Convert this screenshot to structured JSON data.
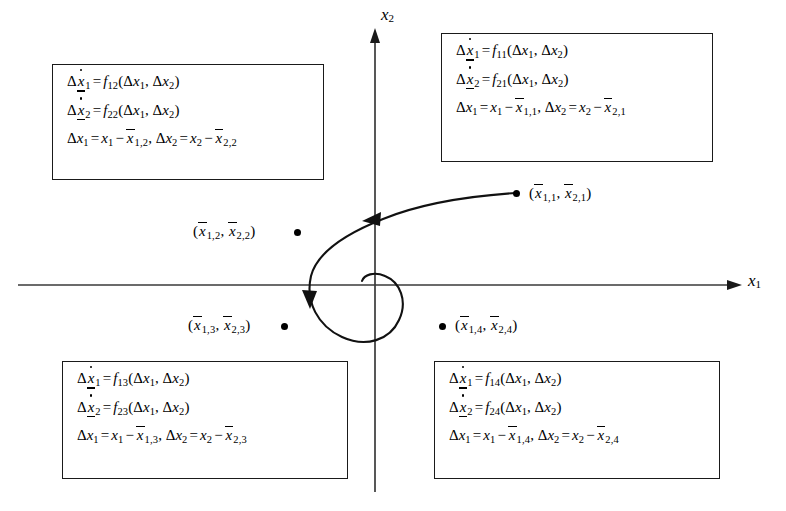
{
  "figure": {
    "type": "phase-plane-diagram"
  },
  "axes": {
    "x_label": "x",
    "x_sub": "1",
    "y_label": "x",
    "y_sub": "2",
    "origin": {
      "x": 375,
      "y": 285
    },
    "x_axis": {
      "x_start": 18,
      "x_end": 742,
      "y": 285
    },
    "y_axis": {
      "x": 375,
      "y_start": 28,
      "y_end": 492
    }
  },
  "symbols": {
    "delta": "Δ",
    "equals": "=",
    "minus": "−",
    "comma": ",",
    "lparen": "(",
    "rparen": ")",
    "x": "x",
    "f": "f",
    "dot_marker": "●"
  },
  "boxes": [
    {
      "id": "q1",
      "quadrant": "top-right",
      "f_row1": "11",
      "f_row2": "21",
      "ss_sub1": "1,1",
      "ss_sub2": "2,1",
      "lines": [
        "Δẋ̱₁ = f₁₁(Δx₁, Δx₂)",
        "Δẋ̱₂ = f₂₁(Δx₁, Δx₂)",
        "Δx₁ = x₁ − x̄₁,₁, Δx₂ = x₂ − x̄₂,₁"
      ]
    },
    {
      "id": "q2",
      "quadrant": "top-left",
      "f_row1": "12",
      "f_row2": "22",
      "ss_sub1": "1,2",
      "ss_sub2": "2,2",
      "lines": [
        "Δẋ̱₁ = f₁₂(Δx₁, Δx₂)",
        "Δẋ̱₂ = f₂₂(Δx₁, Δx₂)",
        "Δx₁ = x₁ − x̄₁,₂, Δx₂ = x₂ − x̄₂,₂"
      ]
    },
    {
      "id": "q3",
      "quadrant": "bottom-left",
      "f_row1": "13",
      "f_row2": "23",
      "ss_sub1": "1,3",
      "ss_sub2": "2,3",
      "lines": [
        "Δẋ̱₁ = f₁₃(Δx₁, Δx₂)",
        "Δẋ̱₂ = f₂₃(Δx₁, Δx₂)",
        "Δx₁ = x₁ − x̄₁,₃, Δx₂ = x₂ − x̄₂,₃"
      ]
    },
    {
      "id": "q4",
      "quadrant": "bottom-right",
      "f_row1": "14",
      "f_row2": "24",
      "ss_sub1": "1,4",
      "ss_sub2": "2,4",
      "lines": [
        "Δẋ̱₁ = f₁₄(Δx₁, Δx₂)",
        "Δẋ̱₂ = f₂₄(Δx₁, Δx₂)",
        "Δx₁ = x₁ − x̄₁,₄, Δx₂ = x₂ − x̄₂,₄"
      ]
    }
  ],
  "points": [
    {
      "id": "p1",
      "sub1": "1,1",
      "sub2": "2,1",
      "label": "(x̄1,1, x̄2,1)",
      "dot": {
        "x": 513,
        "y": 190
      },
      "bullet_side": "left"
    },
    {
      "id": "p2",
      "sub1": "1,2",
      "sub2": "2,2",
      "label": "(x̄1,2, x̄2,2)",
      "dot": {
        "x": 294,
        "y": 229
      },
      "bullet_side": "right"
    },
    {
      "id": "p3",
      "sub1": "1,3",
      "sub2": "2,3",
      "label": "(x̄1,3, x̄2,3)",
      "dot": {
        "x": 281,
        "y": 323
      },
      "bullet_side": "right"
    },
    {
      "id": "p4",
      "sub1": "1,4",
      "sub2": "2,4",
      "label": "(x̄1,4, x̄2,4)",
      "dot": {
        "x": 439,
        "y": 323
      },
      "bullet_side": "left"
    }
  ],
  "trajectory": {
    "description": "Counterclockwise inward spiral starting at operating point 1 and converging near the origin",
    "direction": "counterclockwise",
    "arrowheads": [
      {
        "at": [
          372,
          218
        ],
        "points": "left"
      },
      {
        "at": [
          311,
          301
        ],
        "points": "down"
      }
    ]
  },
  "colors": {
    "ink": "#000000",
    "axis": "#3a3a3a",
    "box_border": "#1a1a1a",
    "background": "#ffffff"
  }
}
